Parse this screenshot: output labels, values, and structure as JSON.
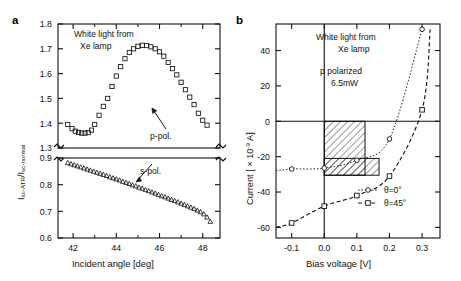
{
  "figure": {
    "background": "#ffffff",
    "ink": "#111111"
  },
  "panel_a": {
    "letter": "a",
    "annotations": {
      "source_line1": "White light from",
      "source_line2": "Xe lamp",
      "p_label": "p-pol.",
      "s_label": "s-pol."
    },
    "axis": {
      "xlabel": "Incident angle [deg]",
      "ylabel_main": "I",
      "ylabel_sub1": "sc-ATR",
      "ylabel_mid": "/I",
      "ylabel_sub2": "sc-normal",
      "xticks": [
        "42",
        "44",
        "46",
        "48"
      ],
      "xtick_values": [
        42,
        44,
        46,
        48
      ],
      "yticks_upper": [
        "1.8",
        "1.7",
        "1.6",
        "1.5",
        "1.4",
        "1.3"
      ],
      "yticks_lower": [
        "0.9",
        "0.8",
        "0.7",
        "0.6"
      ],
      "xlim": [
        41.3,
        48.8
      ],
      "ylim_upper": [
        1.3,
        1.8
      ],
      "ylim_lower": [
        0.6,
        0.9
      ],
      "axis_break": true
    }
  },
  "panel_b": {
    "letter": "b",
    "annotations": {
      "source_line1": "White light from",
      "source_line2": "Xe lamp",
      "pol_line1": "p polarized",
      "pol_line2": "6.5mW"
    },
    "axis": {
      "xlabel": "Bias voltage [V]",
      "ylabel_main": "Current [ × 10",
      "ylabel_exp": "-9",
      "ylabel_tail": " A]",
      "xticks": [
        "-0.1",
        "0.0",
        "0.1",
        "0.2",
        "0.3"
      ],
      "xtick_values": [
        -0.1,
        0.0,
        0.1,
        0.2,
        0.3
      ],
      "yticks": [
        "40",
        "20",
        "0",
        "-20",
        "-40",
        "-60"
      ],
      "ytick_values": [
        40,
        20,
        0,
        -20,
        -40,
        -60
      ],
      "xlim": [
        -0.148,
        0.355
      ],
      "ylim": [
        -66,
        55
      ]
    },
    "legend": [
      {
        "label": "θ=0°",
        "marker": "circle",
        "line": "dotted"
      },
      {
        "label": "θ=45°",
        "marker": "square",
        "line": "dashed"
      }
    ],
    "hatched_regions": [
      {
        "x0": 0.0,
        "x1": 0.125,
        "y0": -30.5,
        "y1": 0.0
      },
      {
        "x0": 0.0,
        "x1": 0.168,
        "y0": -30.5,
        "y1": -21.0
      }
    ]
  },
  "chart_data": [
    {
      "type": "scatter",
      "panel": "a",
      "title": "",
      "xlabel": "Incident angle [deg]",
      "ylabel": "Isc-ATR/Isc-normal",
      "xlim": [
        41.3,
        48.8
      ],
      "ylim_upper": [
        1.3,
        1.8
      ],
      "ylim_lower": [
        0.6,
        0.9
      ],
      "axis_break": [
        1.3,
        0.9
      ],
      "grid": false,
      "legend_position": "inline-annotations",
      "series": [
        {
          "name": "p-pol.",
          "marker": "open-square",
          "x": [
            41.75,
            41.95,
            42.1,
            42.25,
            42.4,
            42.55,
            42.7,
            42.85,
            43.0,
            43.2,
            43.4,
            43.6,
            43.8,
            44.0,
            44.2,
            44.4,
            44.6,
            44.8,
            45.0,
            45.2,
            45.4,
            45.6,
            45.8,
            46.0,
            46.2,
            46.4,
            46.6,
            46.8,
            47.0,
            47.2,
            47.4,
            47.6,
            47.8,
            48.0,
            48.2
          ],
          "y": [
            1.395,
            1.378,
            1.368,
            1.363,
            1.36,
            1.36,
            1.362,
            1.372,
            1.395,
            1.432,
            1.468,
            1.5,
            1.548,
            1.59,
            1.628,
            1.66,
            1.685,
            1.7,
            1.71,
            1.714,
            1.713,
            1.708,
            1.7,
            1.688,
            1.67,
            1.645,
            1.62,
            1.595,
            1.565,
            1.535,
            1.505,
            1.475,
            1.44,
            1.412,
            1.392
          ]
        },
        {
          "name": "s-pol.",
          "marker": "open-triangle",
          "x": [
            41.75,
            41.9,
            42.05,
            42.2,
            42.35,
            42.5,
            42.65,
            42.8,
            42.95,
            43.1,
            43.25,
            43.4,
            43.55,
            43.7,
            43.85,
            44.0,
            44.15,
            44.3,
            44.45,
            44.6,
            44.75,
            44.9,
            45.05,
            45.2,
            45.35,
            45.5,
            45.65,
            45.8,
            45.95,
            46.1,
            46.25,
            46.4,
            46.55,
            46.7,
            46.85,
            47.0,
            47.15,
            47.3,
            47.45,
            47.6,
            47.75,
            47.9,
            48.05,
            48.2,
            48.35
          ],
          "y": [
            0.882,
            0.878,
            0.874,
            0.87,
            0.866,
            0.862,
            0.858,
            0.854,
            0.85,
            0.846,
            0.842,
            0.838,
            0.834,
            0.829,
            0.825,
            0.821,
            0.817,
            0.812,
            0.808,
            0.804,
            0.799,
            0.795,
            0.79,
            0.786,
            0.781,
            0.777,
            0.772,
            0.768,
            0.763,
            0.758,
            0.754,
            0.749,
            0.744,
            0.74,
            0.735,
            0.73,
            0.725,
            0.72,
            0.715,
            0.71,
            0.704,
            0.698,
            0.69,
            0.678,
            0.662
          ]
        }
      ]
    },
    {
      "type": "line",
      "panel": "b",
      "title": "",
      "xlabel": "Bias voltage [V]",
      "ylabel": "Current [ × 10^-9 A]",
      "xlim": [
        -0.148,
        0.355
      ],
      "ylim": [
        -66,
        55
      ],
      "grid": false,
      "legend_position": "lower-right",
      "series": [
        {
          "name": "θ=0°",
          "marker": "open-circle",
          "linestyle": "dotted",
          "x": [
            -0.148,
            -0.1,
            0.0,
            0.1,
            0.2,
            0.3
          ],
          "y": [
            -28.0,
            -27.0,
            -26.5,
            -22.0,
            -10.0,
            52.0
          ]
        },
        {
          "name": "θ=45°",
          "marker": "open-square",
          "linestyle": "dashed",
          "x": [
            -0.148,
            -0.1,
            0.0,
            0.1,
            0.2,
            0.3,
            0.325
          ],
          "y": [
            -60.0,
            -57.5,
            -48.0,
            -42.0,
            -31.0,
            6.5,
            52.0
          ]
        }
      ],
      "annotations": [
        "White light from",
        "Xe lamp",
        "p polarized",
        "6.5mW"
      ]
    }
  ]
}
